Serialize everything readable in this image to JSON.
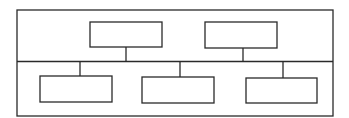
{
  "diagram": {
    "type": "hierarchy",
    "upper_tier": [
      {
        "id": "upper-left",
        "label": ""
      },
      {
        "id": "upper-right",
        "label": ""
      }
    ],
    "lower_tier": [
      {
        "id": "lower-left",
        "label": ""
      },
      {
        "id": "lower-middle",
        "label": ""
      },
      {
        "id": "lower-right",
        "label": ""
      }
    ],
    "connections": [
      {
        "from": "upper-left",
        "to": "bus"
      },
      {
        "from": "upper-right",
        "to": "bus"
      },
      {
        "from": "bus",
        "to": "lower-left"
      },
      {
        "from": "bus",
        "to": "lower-middle"
      },
      {
        "from": "bus",
        "to": "lower-right"
      }
    ],
    "line_color": "#2a2a2a"
  }
}
